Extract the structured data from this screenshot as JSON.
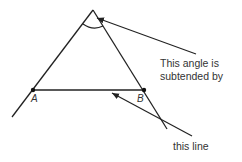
{
  "diagram": {
    "points": [
      {
        "id": "A",
        "label": "A",
        "x": 33,
        "y": 90
      },
      {
        "id": "B",
        "label": "B",
        "x": 144,
        "y": 90
      }
    ],
    "apex": {
      "x": 93,
      "y": 10
    },
    "annotations": {
      "angle_line1": "This angle is",
      "angle_line2": "subtended by",
      "line_label": "this line"
    },
    "colors": {
      "stroke": "#222222",
      "text": "#333333",
      "background": "#ffffff"
    }
  }
}
